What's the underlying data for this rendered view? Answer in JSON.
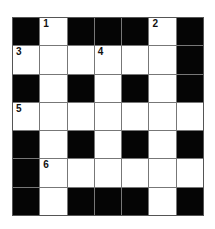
{
  "puzzle": {
    "rows": 7,
    "cols": 7,
    "grid": [
      "BWBBBWB",
      "WWWWWWB",
      "BWBWBWB",
      "WWWWWWW",
      "BWBWBWB",
      "BWWWWWW",
      "BWBBBWB"
    ],
    "numbers": [
      {
        "row": 0,
        "col": 1,
        "n": "1"
      },
      {
        "row": 0,
        "col": 5,
        "n": "2"
      },
      {
        "row": 1,
        "col": 0,
        "n": "3"
      },
      {
        "row": 1,
        "col": 3,
        "n": "4"
      },
      {
        "row": 3,
        "col": 0,
        "n": "5"
      },
      {
        "row": 5,
        "col": 1,
        "n": "6"
      }
    ]
  }
}
